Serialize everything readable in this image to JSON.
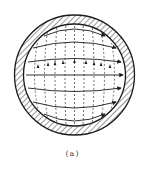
{
  "figure": {
    "caption": "(a)",
    "colors": {
      "line": "#1a1a1a",
      "hatch": "#333333",
      "background": "#ffffff"
    },
    "geometry": {
      "center": [
        74.5,
        75
      ],
      "outer_radius": 60,
      "inner_radius": 51
    },
    "solid_field_lines": 7,
    "dashed_field_lines": 9
  }
}
